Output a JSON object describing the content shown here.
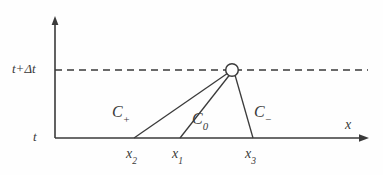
{
  "figure": {
    "type": "characteristics-diagram",
    "canvas": {
      "width": 383,
      "height": 175,
      "background": "#fefefe"
    },
    "colors": {
      "line": "#3a3a3a",
      "dashed": "#3a3a3a",
      "node_fill": "#ffffff",
      "node_stroke": "#3a3a3a",
      "text": "#3a3a3a"
    },
    "axes": {
      "vertical": {
        "label": "t",
        "upper_level_label": "t+Δt",
        "x": 55,
        "y_top": 18,
        "y_bottom": 138,
        "arrow": "up"
      },
      "horizontal": {
        "label": "x",
        "y": 138,
        "x_left": 55,
        "x_right": 368,
        "arrow": "right"
      }
    },
    "dashed_line": {
      "label": "t+Δt level",
      "y": 70,
      "x_start": 55,
      "x_end": 368,
      "dash_pattern": "7 5"
    },
    "node": {
      "label": "solution-point",
      "x": 232,
      "y": 70,
      "radius": 6.5
    },
    "characteristics": [
      {
        "name": "C_plus",
        "label": "C",
        "subscript": "+",
        "base_x": 134,
        "base_y": 138,
        "tip_x": 232,
        "tip_y": 70,
        "label_x": 112,
        "label_y": 104
      },
      {
        "name": "C_zero",
        "label": "C",
        "subscript": "0",
        "base_x": 180,
        "base_y": 138,
        "tip_x": 232,
        "tip_y": 70,
        "label_x": 192,
        "label_y": 111
      },
      {
        "name": "C_minus",
        "label": "C",
        "subscript": "−",
        "base_x": 253,
        "base_y": 138,
        "tip_x": 232,
        "tip_y": 70,
        "label_x": 254,
        "label_y": 104
      }
    ],
    "x_ticks": [
      {
        "name": "x2",
        "label": "x",
        "subscript": "2",
        "x": 134,
        "label_x": 126,
        "label_y": 147
      },
      {
        "name": "x1",
        "label": "x",
        "subscript": "1",
        "x": 180,
        "label_x": 172,
        "label_y": 147
      },
      {
        "name": "x3",
        "label": "x",
        "subscript": "3",
        "x": 253,
        "label_x": 245,
        "label_y": 147
      }
    ]
  }
}
